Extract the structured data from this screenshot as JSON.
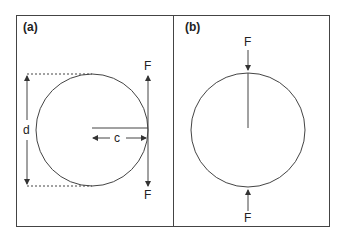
{
  "figure": {
    "panels": [
      {
        "id": "a",
        "label": "(a)",
        "force_top": "F",
        "force_bottom": "F",
        "diameter_label": "d",
        "offset_label": "c"
      },
      {
        "id": "b",
        "label": "(b)",
        "force_top": "F",
        "force_bottom": "F"
      }
    ],
    "colors": {
      "line": "#333333",
      "background": "#ffffff"
    }
  }
}
